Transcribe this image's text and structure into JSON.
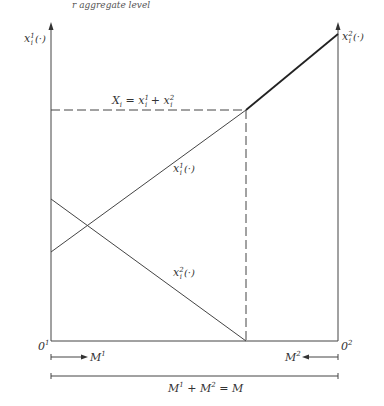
{
  "top_clipped_text": "r aggregate level",
  "axes": {
    "left": {
      "label_main": "x",
      "label_sub": "i",
      "label_sup": "1",
      "label_arg": "(·)",
      "origin_label": "0",
      "origin_sup": "1"
    },
    "right": {
      "label_main": "x",
      "label_sub": "i",
      "label_sup": "2",
      "label_arg": "(·)",
      "origin_label": "0",
      "origin_sup": "2"
    }
  },
  "curves": {
    "x1": {
      "label_main": "x",
      "label_sub": "i",
      "label_sup": "1",
      "label_arg": "(·)"
    },
    "x2": {
      "label_main": "x",
      "label_sub": "i",
      "label_sup": "2",
      "label_arg": "(·)"
    },
    "total": {
      "label": "X",
      "label_sub": "i",
      "eq": " = x",
      "sup1": "1",
      "plus": " + x",
      "sup2": "2",
      "sub": "i"
    }
  },
  "bottom": {
    "m1": {
      "main": "M",
      "sup": "1"
    },
    "m2": {
      "main": "M",
      "sup": "2"
    },
    "total": {
      "text1": "M",
      "sup1": "1",
      "text2": " + M",
      "sup2": "2",
      "text3": " = M"
    }
  },
  "colors": {
    "line": "#333333",
    "dashed": "#444444"
  }
}
